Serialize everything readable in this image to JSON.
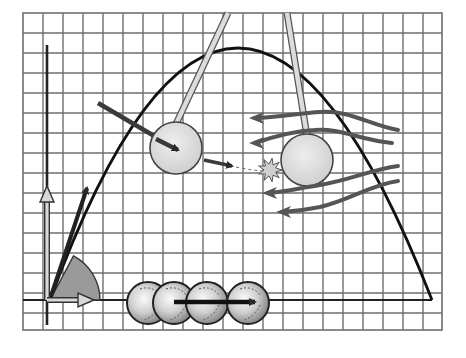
{
  "diagram": {
    "title": "",
    "grid": {
      "x0": 23,
      "y0": 13,
      "x1": 442,
      "y1": 330,
      "cell": 20,
      "line_color": "#6f6f6f",
      "background": "#ffffff"
    },
    "axes": {
      "origin": [
        47,
        300
      ],
      "y_axis_top": 45,
      "y_axis_bottom": 325,
      "ground_line_x_end": 432,
      "color": "#222222"
    },
    "trajectory": {
      "start": [
        50,
        300
      ],
      "peak": [
        238,
        48
      ],
      "end": [
        432,
        300
      ],
      "color": "#111111"
    },
    "launch_vectors": {
      "velocity": {
        "to": [
          87,
          188
        ],
        "color": "#222222"
      },
      "trajectory_tangent": {
        "to": [
          98,
          175
        ],
        "color": "#222222"
      },
      "vertical_component": {
        "to": [
          47,
          190
        ],
        "color": "#d8d8d8"
      },
      "horizontal_component": {
        "to": [
          90,
          300
        ],
        "color": "#d8d8d8"
      },
      "angle_sector": {
        "radius": 50,
        "angle_deg": 62,
        "color": "#9a9a9a"
      }
    },
    "pendulums": [
      {
        "name": "left",
        "rod_top": [
          228,
          13
        ],
        "bob_center": [
          176,
          148
        ],
        "bob_radius": 26,
        "color": "#d9d9d9"
      },
      {
        "name": "right",
        "rod_top": [
          287,
          13
        ],
        "bob_center": [
          307,
          160
        ],
        "bob_radius": 26,
        "color": "#d9d9d9"
      }
    ],
    "impact": {
      "center": [
        270,
        170
      ],
      "label": "collision-burst",
      "color": "#cfcfcf"
    },
    "incoming_arrow": {
      "from": [
        98,
        103
      ],
      "to": [
        178,
        150
      ],
      "color": "#3a3a3a"
    },
    "motion_arrow": {
      "from": [
        204,
        160
      ],
      "to": [
        232,
        166
      ],
      "color": "#3a3a3a"
    },
    "flow_arrows": [
      {
        "path": "M 398 130 C 370 125, 350 110, 320 112 C 300 113, 280 117, 255 118",
        "head": [
          255,
          118
        ]
      },
      {
        "path": "M 392 143 C 360 140, 340 128, 315 130 C 295 131, 278 135, 255 143",
        "head": [
          255,
          143
        ]
      },
      {
        "path": "M 398 166 C 370 170, 350 180, 320 185 C 300 188, 285 192, 268 193",
        "head": [
          268,
          193
        ]
      },
      {
        "path": "M 398 181 C 370 185, 350 200, 320 207 C 305 210, 295 211, 282 212",
        "head": [
          282,
          212
        ]
      }
    ],
    "rolling_balls": [
      {
        "cx": 148,
        "cy": 303,
        "r": 21
      },
      {
        "cx": 174,
        "cy": 303,
        "r": 21
      },
      {
        "cx": 207,
        "cy": 303,
        "r": 21
      },
      {
        "cx": 248,
        "cy": 303,
        "r": 21
      }
    ],
    "rolling_arrow": {
      "from": [
        174,
        302
      ],
      "to": [
        255,
        302
      ],
      "color": "#111111"
    }
  }
}
